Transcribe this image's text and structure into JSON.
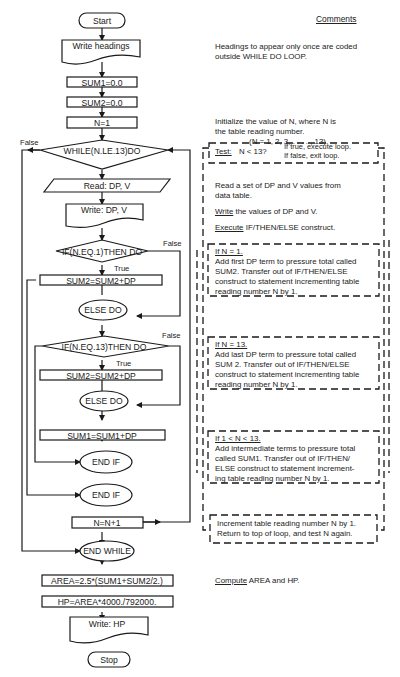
{
  "flowchart": {
    "start": "Start",
    "write_headings": "Write headings",
    "sum1_init": "SUM1=0.0",
    "sum2_init": "SUM2=0.0",
    "n_init": "N=1",
    "while": "WHILE(N.LE.13)DO",
    "while_false": "False",
    "read": "Read:  DP, V",
    "write_dpv": "Write:  DP, V",
    "if1": "IF(N.EQ.1)THEN DO",
    "if1_false": "False",
    "if1_true": "True",
    "sum2_add_1": "SUM2=SUM2+DP",
    "else1": "ELSE DO",
    "if2": "IF(N.EQ.13)THEN DO",
    "if2_false": "False",
    "if2_true": "True",
    "sum2_add_2": "SUM2=SUM2+DP",
    "else2": "ELSE DO",
    "sum1_add": "SUM1=SUM1+DP",
    "endif_inner": "END IF",
    "endif_outer": "END IF",
    "n_increment": "N=N+1",
    "end_while": "END WHILE",
    "area": "AREA=2.5*(SUM1+SUM2/2.)",
    "hp": "HP=AREA*4000./792000.",
    "write_hp": "Write:  HP",
    "stop": "Stop"
  },
  "comments": {
    "heading": "Comments",
    "headings_note_1": "Headings to appear only once are coded",
    "headings_note_2": "outside WHILE DO LOOP.",
    "init_n_1": "Initialize the value of N, where N is",
    "init_n_2": "the table reading number.",
    "init_n_3": "(N = 1, 2, 3, . . . . , 13).",
    "test_label": "Test:",
    "test_expr": "N < 13?",
    "test_true": "If true, execute loop.",
    "test_false": "If false, exit loop.",
    "read_note_1": "Read a set of DP and V values from",
    "read_note_2": "data table.",
    "write_note_word": "Write",
    "write_note_rest": " the values of DP and V.",
    "execute_word": "Execute",
    "execute_rest": " IF/THEN/ELSE construct.",
    "case1_title": "If N = 1.",
    "case1_l1": "Add first DP term to pressure total called",
    "case1_l2": "SUM2.  Transfer out of IF/THEN/ELSE",
    "case1_l3": "construct to statement incrementing table",
    "case1_l4": "reading number N by 1.",
    "case2_title": "If N = 13.",
    "case2_l1": "Add last DP term to pressure total called",
    "case2_l2": "SUM 2.  Transfer out of IF/THEN/ELSE",
    "case2_l3": "construct to statement incrementing table",
    "case2_l4": "reading number N by 1.",
    "case3_title": "If 1 < N < 13.",
    "case3_l1": "Add intermediate terms to pressure total",
    "case3_l2": "called SUM1.  Transfer out of IF/THEN/",
    "case3_l3": "ELSE construct to statement increment-",
    "case3_l4": "ing table reading number N by 1.",
    "incr_l1": "Increment table reading number N by 1.",
    "incr_l2": "Return to top of loop, and test N again.",
    "compute_word": "Compute",
    "compute_rest": " AREA and HP."
  }
}
